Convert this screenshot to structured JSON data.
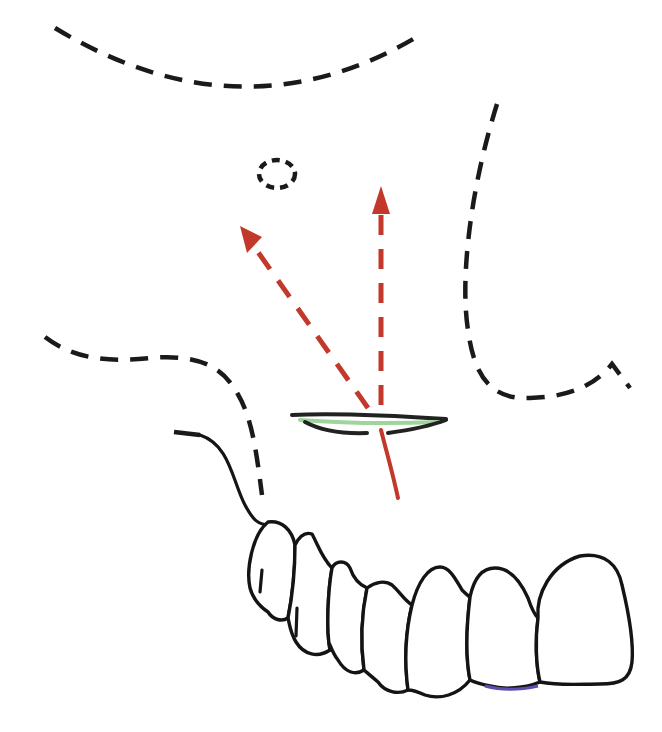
{
  "diagram": {
    "colors": {
      "background": "#ffffff",
      "outline": "#1a1a1a",
      "vector": "#c2392c",
      "incision_highlight": "#9fd49a",
      "incision_dark": "#222222",
      "tooth_edge_accent": "#5a4fb0"
    },
    "dashed_outlines": [
      {
        "name": "orbital-rim-outline",
        "d": "M 55 28 Q 240 140 415 38",
        "dash": "18 12"
      },
      {
        "name": "infraorbital-foramen-outline",
        "shape": "ellipse",
        "cx": 277,
        "cy": 174,
        "rx": 18,
        "ry": 14,
        "dash": "8 6"
      },
      {
        "name": "zygomatic-buttress-outline",
        "d": "M 497 104 C 470 190 460 280 468 330 C 474 375 490 400 530 398 C 570 397 595 385 612 364 L 630 388",
        "dash": "18 12"
      },
      {
        "name": "nasal-floor-outline",
        "d": "M 45 337 C 75 360 110 362 150 358 C 185 355 215 360 232 385 C 252 412 256 450 262 495",
        "dash": "18 12"
      },
      {
        "name": "alveolar-ridge-dash",
        "d": "M 174 432 L 200 435",
        "dash": "none"
      }
    ],
    "solid_outlines": [
      {
        "name": "alveolar-contour-line",
        "d": "M 200 435 C 230 445 232 480 245 505 C 253 520 258 525 270 525"
      }
    ],
    "teeth": [
      {
        "name": "tooth-molar-2",
        "d": "M 268 522 C 252 535 246 570 250 588 C 254 602 262 608 268 612 C 273 620 282 622 288 618 C 292 598 295 572 295 545 C 292 530 282 520 268 522 Z",
        "groove": "M 262 570 L 260 592"
      },
      {
        "name": "tooth-molar-1",
        "d": "M 295 545 C 300 535 306 532 312 534 C 318 545 322 558 332 568 C 328 590 326 630 330 650 C 318 658 304 655 296 642 C 290 632 290 626 288 618 C 292 598 295 572 295 545 Z",
        "groove": "M 297 608 L 296 636"
      },
      {
        "name": "tooth-premolar-2",
        "d": "M 332 568 C 336 560 346 560 350 568 C 354 580 360 585 367 588 C 362 612 360 640 364 670 C 355 676 345 672 338 660 C 330 650 328 635 330 650 C 326 630 328 590 332 568 Z"
      },
      {
        "name": "tooth-premolar-1",
        "d": "M 367 588 C 375 582 385 580 392 585 C 400 592 404 600 412 605 C 406 630 404 660 408 690 C 398 695 385 692 378 682 C 370 675 366 672 364 670 C 360 640 362 612 367 588 Z"
      },
      {
        "name": "tooth-canine",
        "d": "M 412 605 C 418 582 428 567 440 567 C 450 567 456 580 462 590 C 466 594 468 596 470 597 C 466 630 466 660 470 680 C 458 695 440 700 425 695 C 414 690 410 690 408 690 C 404 660 406 630 412 605 Z"
      },
      {
        "name": "tooth-lateral-incisor",
        "d": "M 470 597 C 474 578 482 568 495 568 C 510 568 520 580 528 598 C 532 610 535 615 538 618 C 535 640 536 665 540 682 C 525 688 505 690 490 686 C 480 684 474 682 470 680 C 466 660 466 630 470 597 Z"
      },
      {
        "name": "tooth-central-incisor",
        "d": "M 538 618 C 536 595 550 565 580 556 C 605 552 618 565 622 585 C 628 610 634 640 632 662 C 630 680 620 684 600 684 C 580 684 560 686 540 682 C 536 665 535 640 538 618 Z"
      }
    ],
    "tooth_accent": {
      "name": "incisal-edge-accent",
      "d": "M 485 686 C 500 690 520 690 538 686"
    },
    "incision": {
      "name": "vestibular-incision",
      "dark_upper": "M 292 415 C 330 413 400 416 446 419",
      "highlight": "M 300 420 C 340 423 390 424 440 422",
      "dark_lower_left": "M 305 422 C 320 430 340 434 367 433",
      "dark_lower_right": "M 388 433 C 410 430 430 426 446 420"
    },
    "vectors": [
      {
        "name": "vertical-vector-arrow",
        "shaft": "M 381 405 L 381 212",
        "dash": "20 14",
        "head": "372,214 390,214 381,186"
      },
      {
        "name": "oblique-vector-arrow",
        "shaft": "M 368 408 L 253 245",
        "dash": "20 14",
        "head": "240,226 262,237 247,253"
      }
    ],
    "source_line": {
      "name": "vector-origin-line",
      "d": "M 381 430 C 386 450 392 470 398 498"
    }
  }
}
